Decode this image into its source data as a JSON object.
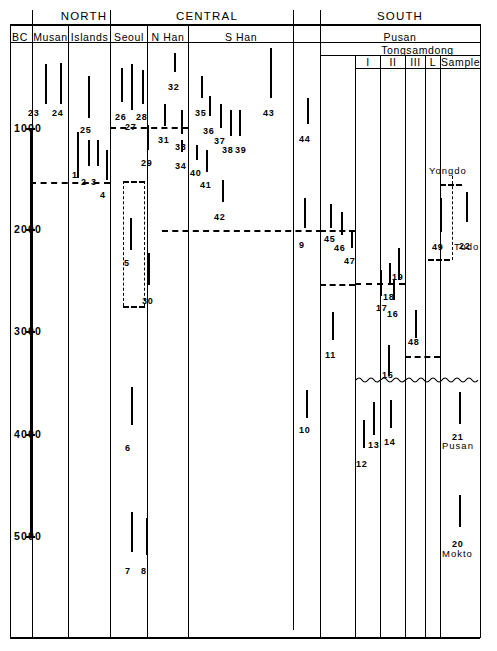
{
  "figure": {
    "title_regions": [
      {
        "label": "NORTH",
        "x": 48,
        "y": 10,
        "w": 72
      },
      {
        "label": "CENTRAL",
        "x": 121,
        "y": 10,
        "w": 172
      },
      {
        "label": "SOUTH",
        "x": 320,
        "y": 10,
        "w": 160
      }
    ],
    "subheaders": [
      {
        "label": "BC",
        "x": 8,
        "y": 31,
        "w": 24
      },
      {
        "label": "Musan",
        "x": 33,
        "y": 31,
        "w": 35
      },
      {
        "label": "Islands",
        "x": 69,
        "y": 31,
        "w": 41
      },
      {
        "label": "Seoul",
        "x": 111,
        "y": 31,
        "w": 36
      },
      {
        "label": "N Han",
        "x": 148,
        "y": 31,
        "w": 40
      },
      {
        "label": "S Han",
        "x": 189,
        "y": 31,
        "w": 104
      },
      {
        "label": "Pusan",
        "x": 320,
        "y": 31,
        "w": 160
      },
      {
        "label": "Tongsamdong",
        "x": 355,
        "y": 44,
        "w": 125
      },
      {
        "label": "I",
        "x": 356,
        "y": 56,
        "w": 24
      },
      {
        "label": "II",
        "x": 381,
        "y": 56,
        "w": 24
      },
      {
        "label": "III",
        "x": 406,
        "y": 56,
        "w": 19
      },
      {
        "label": "L",
        "x": 426,
        "y": 56,
        "w": 14
      },
      {
        "label": "Sample",
        "x": 441,
        "y": 56,
        "w": 39
      }
    ],
    "axis_ticks": [
      {
        "label": "1000",
        "y": 128
      },
      {
        "label": "2000",
        "y": 229
      },
      {
        "label": "3000",
        "y": 331
      },
      {
        "label": "4000",
        "y": 434
      },
      {
        "label": "5000",
        "y": 536
      }
    ],
    "site_labels": [
      {
        "text": "Yongdo",
        "x": 429,
        "y": 165
      },
      {
        "text": "Tudo",
        "x": 454,
        "y": 241
      },
      {
        "text": "Pusan",
        "x": 442,
        "y": 440
      },
      {
        "text": "Mokto",
        "x": 442,
        "y": 548
      }
    ]
  },
  "chart_data": {
    "type": "range",
    "ylabel": "BC",
    "ylim": [
      200,
      5700
    ],
    "ytick_labels": [
      "1000",
      "2000",
      "3000",
      "4000",
      "5000"
    ],
    "ytick_values": [
      1000,
      2000,
      3000,
      4000,
      5000
    ],
    "grid": false,
    "columns": [
      "Musan",
      "Islands",
      "Seoul",
      "N Han",
      "S Han",
      "Pusan",
      "Tongsamdong I",
      "Tongsamdong II",
      "Tongsamdong III",
      "Tongsamdong L",
      "Sample"
    ],
    "samples": [
      {
        "id": "23",
        "column": "Musan",
        "x": 45,
        "top": 64,
        "bottom": 104,
        "label_x": 28,
        "label_y": 108
      },
      {
        "id": "24",
        "column": "Musan",
        "x": 60,
        "top": 63,
        "bottom": 104,
        "label_x": 52,
        "label_y": 108
      },
      {
        "id": "25",
        "column": "Islands",
        "x": 88,
        "top": 76,
        "bottom": 118,
        "label_x": 80,
        "label_y": 125
      },
      {
        "id": "1",
        "column": "Islands",
        "x": 77,
        "top": 132,
        "bottom": 178,
        "label_x": 72,
        "label_y": 170
      },
      {
        "id": "2",
        "column": "Islands",
        "x": 88,
        "top": 140,
        "bottom": 166,
        "label_x": 81,
        "label_y": 177
      },
      {
        "id": "3",
        "column": "Islands",
        "x": 97,
        "top": 140,
        "bottom": 166,
        "label_x": 91,
        "label_y": 177
      },
      {
        "id": "4",
        "column": "Islands",
        "x": 106,
        "top": 150,
        "bottom": 180,
        "label_x": 100,
        "label_y": 190
      },
      {
        "id": "26",
        "column": "Seoul",
        "x": 121,
        "top": 68,
        "bottom": 102,
        "label_x": 115,
        "label_y": 112
      },
      {
        "id": "27",
        "column": "Seoul",
        "x": 131,
        "top": 64,
        "bottom": 110,
        "label_x": 125,
        "label_y": 122
      },
      {
        "id": "28",
        "column": "Seoul",
        "x": 142,
        "top": 70,
        "bottom": 104,
        "label_x": 136,
        "label_y": 112
      },
      {
        "id": "29",
        "column": "Seoul",
        "x": 147,
        "top": 125,
        "bottom": 150,
        "label_x": 141,
        "label_y": 158
      },
      {
        "id": "5",
        "column": "Seoul",
        "x": 130,
        "top": 218,
        "bottom": 250,
        "label_x": 124,
        "label_y": 258
      },
      {
        "id": "30",
        "column": "Seoul",
        "x": 148,
        "top": 253,
        "bottom": 285,
        "label_x": 142,
        "label_y": 296
      },
      {
        "id": "6",
        "column": "Seoul",
        "x": 131,
        "top": 387,
        "bottom": 425,
        "label_x": 125,
        "label_y": 443
      },
      {
        "id": "7",
        "column": "Seoul",
        "x": 131,
        "top": 512,
        "bottom": 552,
        "label_x": 125,
        "label_y": 566
      },
      {
        "id": "8",
        "column": "Seoul",
        "x": 146,
        "top": 518,
        "bottom": 555,
        "label_x": 141,
        "label_y": 566
      },
      {
        "id": "32",
        "column": "N Han",
        "x": 174,
        "top": 53,
        "bottom": 72,
        "label_x": 168,
        "label_y": 82
      },
      {
        "id": "31",
        "column": "N Han",
        "x": 164,
        "top": 104,
        "bottom": 126,
        "label_x": 158,
        "label_y": 135
      },
      {
        "id": "33",
        "column": "S Han",
        "x": 181,
        "top": 110,
        "bottom": 134,
        "label_x": 175,
        "label_y": 142
      },
      {
        "id": "34",
        "column": "S Han",
        "x": 181,
        "top": 140,
        "bottom": 152,
        "label_x": 175,
        "label_y": 161
      },
      {
        "id": "35",
        "column": "S Han",
        "x": 201,
        "top": 76,
        "bottom": 98,
        "label_x": 195,
        "label_y": 108
      },
      {
        "id": "36",
        "column": "S Han",
        "x": 209,
        "top": 96,
        "bottom": 116,
        "label_x": 203,
        "label_y": 126
      },
      {
        "id": "37",
        "column": "S Han",
        "x": 220,
        "top": 104,
        "bottom": 128,
        "label_x": 214,
        "label_y": 136
      },
      {
        "id": "38",
        "column": "S Han",
        "x": 230,
        "top": 110,
        "bottom": 136,
        "label_x": 222,
        "label_y": 145
      },
      {
        "id": "39",
        "column": "S Han",
        "x": 239,
        "top": 110,
        "bottom": 136,
        "label_x": 235,
        "label_y": 145
      },
      {
        "id": "40",
        "column": "S Han",
        "x": 196,
        "top": 145,
        "bottom": 160,
        "label_x": 190,
        "label_y": 168
      },
      {
        "id": "41",
        "column": "S Han",
        "x": 206,
        "top": 150,
        "bottom": 172,
        "label_x": 200,
        "label_y": 180
      },
      {
        "id": "42",
        "column": "S Han",
        "x": 222,
        "top": 180,
        "bottom": 202,
        "label_x": 214,
        "label_y": 212
      },
      {
        "id": "43",
        "column": "S Han",
        "x": 270,
        "top": 48,
        "bottom": 98,
        "label_x": 263,
        "label_y": 108
      },
      {
        "id": "44",
        "column": "Pusan",
        "x": 307,
        "top": 98,
        "bottom": 124,
        "label_x": 299,
        "label_y": 134
      },
      {
        "id": "9",
        "column": "Pusan",
        "x": 304,
        "top": 198,
        "bottom": 228,
        "label_x": 299,
        "label_y": 240
      },
      {
        "id": "45",
        "column": "Pusan",
        "x": 330,
        "top": 204,
        "bottom": 228,
        "label_x": 324,
        "label_y": 234
      },
      {
        "id": "46",
        "column": "Pusan",
        "x": 341,
        "top": 212,
        "bottom": 235,
        "label_x": 334,
        "label_y": 243
      },
      {
        "id": "47",
        "column": "Pusan",
        "x": 351,
        "top": 230,
        "bottom": 248,
        "label_x": 344,
        "label_y": 256
      },
      {
        "id": "11",
        "column": "Pusan",
        "x": 332,
        "top": 312,
        "bottom": 340,
        "label_x": 325,
        "label_y": 350
      },
      {
        "id": "10",
        "column": "Pusan",
        "x": 306,
        "top": 390,
        "bottom": 418,
        "label_x": 299,
        "label_y": 425
      },
      {
        "id": "12",
        "column": "Tongsamdong I",
        "x": 363,
        "top": 420,
        "bottom": 448,
        "label_x": 356,
        "label_y": 459
      },
      {
        "id": "13",
        "column": "Tongsamdong I",
        "x": 373,
        "top": 402,
        "bottom": 435,
        "label_x": 368,
        "label_y": 440
      },
      {
        "id": "17",
        "column": "Tongsamdong II",
        "x": 380,
        "top": 270,
        "bottom": 296,
        "label_x": 376,
        "label_y": 303
      },
      {
        "id": "18",
        "column": "Tongsamdong II",
        "x": 389,
        "top": 263,
        "bottom": 285,
        "label_x": 383,
        "label_y": 292
      },
      {
        "id": "19",
        "column": "Tongsamdong II",
        "x": 398,
        "top": 248,
        "bottom": 280,
        "label_x": 392,
        "label_y": 272
      },
      {
        "id": "16",
        "column": "Tongsamdong II",
        "x": 393,
        "top": 280,
        "bottom": 300,
        "label_x": 387,
        "label_y": 309
      },
      {
        "id": "15",
        "column": "Tongsamdong II",
        "x": 388,
        "top": 345,
        "bottom": 376,
        "label_x": 382,
        "label_y": 370
      },
      {
        "id": "14",
        "column": "Tongsamdong II",
        "x": 390,
        "top": 400,
        "bottom": 428,
        "label_x": 384,
        "label_y": 437
      },
      {
        "id": "48",
        "column": "Tongsamdong III",
        "x": 415,
        "top": 310,
        "bottom": 338,
        "label_x": 408,
        "label_y": 337
      },
      {
        "id": "49",
        "column": "Sample",
        "x": 440,
        "top": 198,
        "bottom": 232,
        "label_x": 432,
        "label_y": 242
      },
      {
        "id": "22",
        "column": "Sample",
        "x": 466,
        "top": 192,
        "bottom": 222,
        "label_x": 459,
        "label_y": 241
      },
      {
        "id": "21",
        "column": "Sample",
        "x": 459,
        "top": 392,
        "bottom": 424,
        "label_x": 452,
        "label_y": 432
      },
      {
        "id": "20",
        "column": "Sample",
        "x": 459,
        "top": 495,
        "bottom": 527,
        "label_x": 452,
        "label_y": 539
      }
    ]
  }
}
